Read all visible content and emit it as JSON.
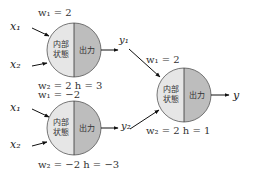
{
  "colors": {
    "left_half": "#e6e6e6",
    "right_half": "#bdbdbd",
    "stroke": "#555555",
    "arrow": "#111111"
  },
  "neurons": [
    {
      "id": "neuron-1",
      "inner_label_line1": "内部",
      "inner_label_line2": "状態",
      "output_label": "出力",
      "w1": "w₁ = 2",
      "w2_h": "w₂ = 2   h = 3",
      "inputs": [
        "x₁",
        "x₂"
      ],
      "output": "y₁"
    },
    {
      "id": "neuron-2",
      "inner_label_line1": "内部",
      "inner_label_line2": "状態",
      "output_label": "出力",
      "w1": "w₁ = −2",
      "w2_h": "w₂ = −2   h = −3",
      "inputs": [
        "x₁",
        "x₂"
      ],
      "output": "y₂"
    },
    {
      "id": "neuron-3",
      "inner_label_line1": "内部",
      "inner_label_line2": "状態",
      "output_label": "出力",
      "w1": "w₁ = 2",
      "w2_h": "w₂ = 2   h = 1",
      "inputs": [
        "y₁",
        "y₂"
      ],
      "output": "y"
    }
  ]
}
